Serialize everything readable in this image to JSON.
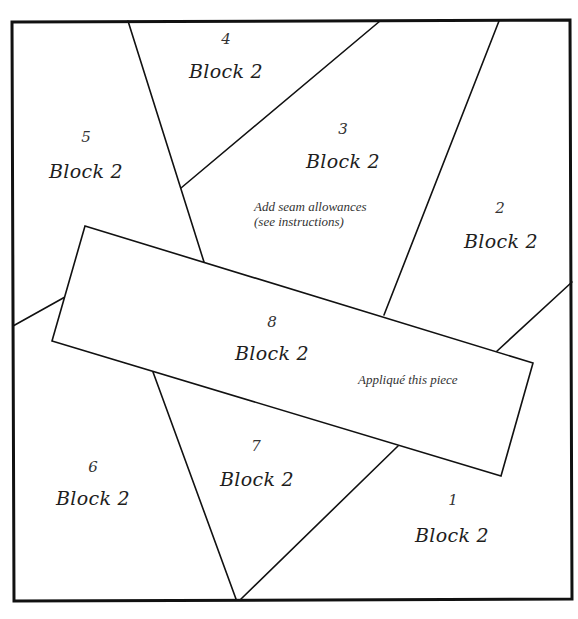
{
  "diagram": {
    "type": "quilt-block-pattern",
    "frame": {
      "x1": 12,
      "y1": 21,
      "x2": 572,
      "y2": 600
    },
    "line_color": "#111111",
    "pieces": [
      {
        "number": "1",
        "label": "Block 2"
      },
      {
        "number": "2",
        "label": "Block 2"
      },
      {
        "number": "3",
        "label": "Block 2"
      },
      {
        "number": "4",
        "label": "Block 2"
      },
      {
        "number": "5",
        "label": "Block 2"
      },
      {
        "number": "6",
        "label": "Block 2"
      },
      {
        "number": "7",
        "label": "Block 2"
      },
      {
        "number": "8",
        "label": "Block 2"
      }
    ],
    "notes": {
      "seam_line1": "Add seam allowances",
      "seam_line2": "(see instructions)",
      "applique": "Appliqué this piece"
    }
  }
}
